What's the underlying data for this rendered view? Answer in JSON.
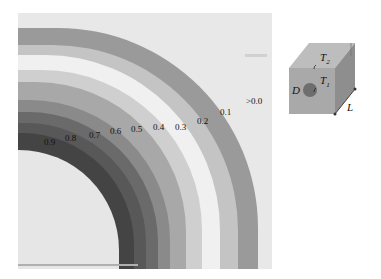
{
  "figure": {
    "type": "contour-map",
    "contour_labels": [
      {
        "text": "0.9",
        "x": 44,
        "y": 138
      },
      {
        "text": "0.8",
        "x": 65,
        "y": 134
      },
      {
        "text": "0.7",
        "x": 89,
        "y": 131
      },
      {
        "text": "0.6",
        "x": 110,
        "y": 127
      },
      {
        "text": "0.5",
        "x": 131,
        "y": 125
      },
      {
        "text": "0.4",
        "x": 153,
        "y": 123
      },
      {
        "text": "0.3",
        "x": 175,
        "y": 123
      },
      {
        "text": "0.2",
        "x": 197,
        "y": 117
      },
      {
        "text": "0.1",
        "x": 220,
        "y": 108
      },
      {
        "text": ">0.0",
        "x": 246,
        "y": 97
      }
    ],
    "bands": [
      {
        "level": ">0.0",
        "color": "#e4e4e4"
      },
      {
        "level": "0.1",
        "color": "#9a9a9a"
      },
      {
        "level": "0.2",
        "color": "#c4c4c4"
      },
      {
        "level": "0.3",
        "color": "#f0f0f0"
      },
      {
        "level": "0.4",
        "color": "#cfcfcf"
      },
      {
        "level": "0.5",
        "color": "#a8a8a8"
      },
      {
        "level": "0.6",
        "color": "#8a8a8a"
      },
      {
        "level": "0.7",
        "color": "#6a6a6a"
      },
      {
        "level": "0.8",
        "color": "#585858"
      },
      {
        "level": "0.9",
        "color": "#444444"
      },
      {
        "level": "hole",
        "color": "#e6e6e6"
      }
    ]
  },
  "inset": {
    "labels": {
      "t2": "T",
      "t2_sub": "2",
      "t1": "T",
      "t1_sub": "1",
      "d": "D",
      "l": "L"
    },
    "colors": {
      "front": "#a9a9a9",
      "top": "#bdbdbd",
      "side": "#8e8e8e",
      "hole": "#6e6e6e"
    }
  }
}
